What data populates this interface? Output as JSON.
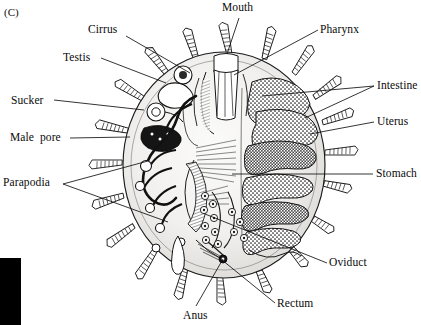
{
  "figure": {
    "panel_tag": "(C)",
    "background_color": "#ffffff",
    "ink_color": "#111111",
    "body_fill": "#f2f1ef",
    "organ_dark": "#1a1a1a"
  },
  "labels": [
    {
      "id": "cirrus",
      "text": "Cirrus",
      "x": 88,
      "y": 24,
      "align": "left"
    },
    {
      "id": "mouth",
      "text": "Mouth",
      "x": 222,
      "y": 2,
      "align": "left"
    },
    {
      "id": "pharynx",
      "text": "Pharynx",
      "x": 320,
      "y": 24,
      "align": "left"
    },
    {
      "id": "testis",
      "text": "Testis",
      "x": 63,
      "y": 52,
      "align": "left"
    },
    {
      "id": "intestine",
      "text": "Intestine",
      "x": 377,
      "y": 80,
      "align": "left"
    },
    {
      "id": "sucker",
      "text": "Sucker",
      "x": 11,
      "y": 95,
      "align": "left"
    },
    {
      "id": "uterus",
      "text": "Uterus",
      "x": 377,
      "y": 116,
      "align": "left"
    },
    {
      "id": "male-pore",
      "text": "Male  pore",
      "x": 10,
      "y": 132,
      "align": "left"
    },
    {
      "id": "stomach",
      "text": "Stomach",
      "x": 376,
      "y": 168,
      "align": "left"
    },
    {
      "id": "parapodia",
      "text": "Parapodia",
      "x": 3,
      "y": 177,
      "align": "left"
    },
    {
      "id": "oviduct",
      "text": "Oviduct",
      "x": 329,
      "y": 257,
      "align": "left"
    },
    {
      "id": "rectum",
      "text": "Rectum",
      "x": 277,
      "y": 298,
      "align": "left"
    },
    {
      "id": "anus",
      "text": "Anus",
      "x": 183,
      "y": 310,
      "align": "left"
    }
  ],
  "leader_lines": [
    {
      "id": "leader-cirrus",
      "points": "126,36 190,73"
    },
    {
      "id": "leader-mouth",
      "points": "239,18 227,54"
    },
    {
      "id": "leader-pharynx",
      "points": "318,30 234,75"
    },
    {
      "id": "leader-testis",
      "points": "101,58 166,83"
    },
    {
      "id": "leader-intestine-a",
      "points": "374,86 262,96"
    },
    {
      "id": "leader-intestine-b",
      "points": "374,86 305,118"
    },
    {
      "id": "leader-sucker",
      "points": "54,100 144,110"
    },
    {
      "id": "leader-uterus",
      "points": "374,122 310,134"
    },
    {
      "id": "leader-male-pore",
      "points": "70,138 130,137"
    },
    {
      "id": "leader-stomach",
      "points": "373,174 232,174"
    },
    {
      "id": "leader-parapodia-a",
      "points": "63,184 148,161"
    },
    {
      "id": "leader-parapodia-b",
      "points": "63,184 168,222"
    },
    {
      "id": "leader-oviduct",
      "points": "327,263 205,214"
    },
    {
      "id": "leader-rectum",
      "points": "275,303 222,260"
    },
    {
      "id": "leader-anus",
      "points": "196,306 223,259"
    }
  ],
  "anatomy_regions": [
    {
      "id": "body-outline",
      "name": "oval body wall"
    },
    {
      "id": "parapodia-ring",
      "name": "radiating parapodia with banded cirri",
      "count": 18
    },
    {
      "id": "mouth-pharynx",
      "name": "mouth opening and pharynx at anterior midline"
    },
    {
      "id": "gut-right",
      "name": "stippled intestine, uterus and stomach lobes on right"
    },
    {
      "id": "repro-left",
      "name": "dark branching testis, sucker, male pore on left"
    },
    {
      "id": "oviduct-eggs",
      "name": "oviduct with ova near posterior midline"
    },
    {
      "id": "rectum-anus",
      "name": "rectum terminating at posterior anus"
    }
  ],
  "black_bar": {
    "x": 0,
    "y": 258,
    "width": 21,
    "height": 67
  }
}
